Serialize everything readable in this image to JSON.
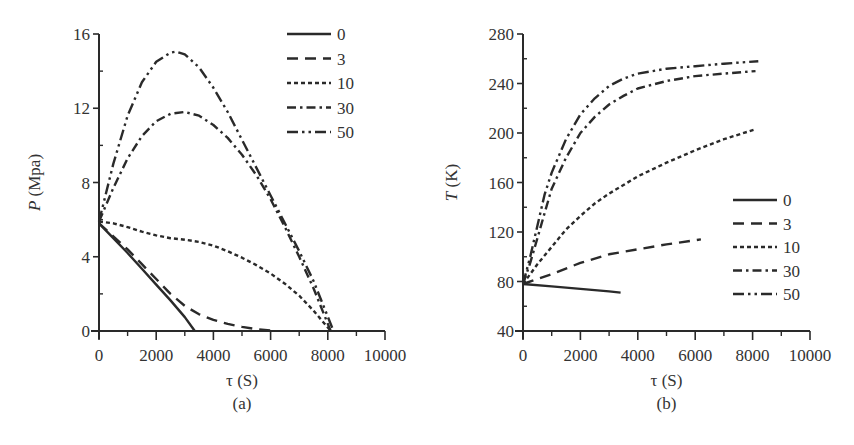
{
  "figure": {
    "panels": [
      "(a)",
      "(b)"
    ]
  },
  "chart_data": [
    {
      "type": "line",
      "panel_label": "(a)",
      "title": "",
      "xlabel": "τ (S)",
      "ylabel_italic": "P",
      "ylabel_rest": " (Mpa)",
      "ylabel": "P (Mpa)",
      "xlim": [
        0,
        10000
      ],
      "ylim": [
        0,
        16
      ],
      "xticks": [
        0,
        2000,
        4000,
        6000,
        8000,
        10000
      ],
      "xtick_labels": [
        "0",
        "2000",
        "4000",
        "6000",
        "8000",
        "10000"
      ],
      "yticks": [
        0,
        4,
        8,
        12,
        16
      ],
      "ytick_labels": [
        "0",
        "4",
        "8",
        "12",
        "16"
      ],
      "x_minor_step": 1000,
      "y_minor_step": 2,
      "grid": false,
      "legend_position": "upper right",
      "series": [
        {
          "name": "0",
          "style": "solid",
          "x": [
            0,
            500,
            1000,
            1500,
            2000,
            2500,
            3000,
            3350
          ],
          "y": [
            5.8,
            5.0,
            4.2,
            3.35,
            2.5,
            1.65,
            0.75,
            0.0
          ]
        },
        {
          "name": "3",
          "style": "dash",
          "x": [
            0,
            500,
            1000,
            1500,
            2000,
            2500,
            3000,
            3500,
            4000,
            4500,
            5000,
            5500,
            6200
          ],
          "y": [
            5.8,
            5.1,
            4.4,
            3.6,
            2.8,
            2.0,
            1.35,
            0.9,
            0.6,
            0.38,
            0.22,
            0.1,
            0.0
          ]
        },
        {
          "name": "10",
          "style": "short-dash",
          "x": [
            0,
            500,
            1000,
            1500,
            2000,
            2500,
            3000,
            3500,
            4000,
            4500,
            5000,
            5500,
            6000,
            6500,
            7000,
            7500,
            8100
          ],
          "y": [
            5.9,
            5.8,
            5.6,
            5.35,
            5.15,
            5.0,
            4.92,
            4.8,
            4.6,
            4.3,
            3.95,
            3.55,
            3.1,
            2.55,
            1.9,
            1.1,
            0.0
          ]
        },
        {
          "name": "30",
          "style": "dash-dot",
          "x": [
            0,
            500,
            1000,
            1500,
            2000,
            2500,
            3000,
            3500,
            4000,
            4500,
            5000,
            5500,
            6000,
            6500,
            7000,
            7500,
            8100
          ],
          "y": [
            5.9,
            7.7,
            9.3,
            10.5,
            11.3,
            11.7,
            11.8,
            11.6,
            11.1,
            10.4,
            9.5,
            8.4,
            7.1,
            5.6,
            4.0,
            2.3,
            0.0
          ]
        },
        {
          "name": "50",
          "style": "dash-dot-dot",
          "x": [
            0,
            500,
            1000,
            1500,
            2000,
            2500,
            2700,
            3000,
            3500,
            4000,
            4500,
            5000,
            5500,
            6000,
            6500,
            7000,
            7500,
            8200
          ],
          "y": [
            5.9,
            9.0,
            11.6,
            13.4,
            14.5,
            15.0,
            15.05,
            14.9,
            14.2,
            13.1,
            11.8,
            10.3,
            8.8,
            7.3,
            5.8,
            4.3,
            2.7,
            0.0
          ]
        }
      ]
    },
    {
      "type": "line",
      "panel_label": "(b)",
      "title": "",
      "xlabel": "τ (S)",
      "ylabel_italic": "T",
      "ylabel_rest": " (K)",
      "ylabel": "T (K)",
      "xlim": [
        0,
        10000
      ],
      "ylim": [
        40,
        280
      ],
      "xticks": [
        0,
        2000,
        4000,
        6000,
        8000,
        10000
      ],
      "xtick_labels": [
        "0",
        "2000",
        "4000",
        "6000",
        "8000",
        "10000"
      ],
      "yticks": [
        40,
        80,
        120,
        160,
        200,
        240,
        280
      ],
      "ytick_labels": [
        "40",
        "80",
        "120",
        "160",
        "200",
        "240",
        "280"
      ],
      "x_minor_step": 1000,
      "y_minor_step": 20,
      "grid": false,
      "legend_position": "center right",
      "series": [
        {
          "name": "0",
          "style": "solid",
          "x": [
            0,
            1000,
            2000,
            3000,
            3400
          ],
          "y": [
            78,
            76,
            74,
            72,
            71
          ]
        },
        {
          "name": "3",
          "style": "dash",
          "x": [
            0,
            500,
            1000,
            2000,
            3000,
            4000,
            5000,
            6200
          ],
          "y": [
            78,
            82,
            86,
            95,
            102,
            106,
            110,
            114
          ]
        },
        {
          "name": "10",
          "style": "short-dash",
          "x": [
            0,
            250,
            500,
            1000,
            1500,
            2000,
            2500,
            3000,
            3500,
            4000,
            5000,
            6000,
            7000,
            8100
          ],
          "y": [
            78,
            86,
            94,
            108,
            122,
            133,
            143,
            151,
            158,
            165,
            176,
            186,
            195,
            203
          ]
        },
        {
          "name": "30",
          "style": "dash-dot",
          "x": [
            0,
            250,
            500,
            750,
            1000,
            1500,
            2000,
            2500,
            3000,
            3500,
            4000,
            5000,
            6000,
            7000,
            8100
          ],
          "y": [
            78,
            95,
            115,
            135,
            155,
            180,
            200,
            213,
            223,
            230,
            236,
            242,
            246,
            248,
            250
          ]
        },
        {
          "name": "50",
          "style": "dash-dot-dot",
          "x": [
            0,
            250,
            500,
            750,
            1000,
            1500,
            2000,
            2500,
            3000,
            3500,
            4000,
            5000,
            6000,
            7000,
            8200
          ],
          "y": [
            78,
            100,
            125,
            150,
            168,
            195,
            215,
            228,
            238,
            244,
            248,
            252,
            254,
            256,
            258
          ]
        }
      ]
    }
  ]
}
